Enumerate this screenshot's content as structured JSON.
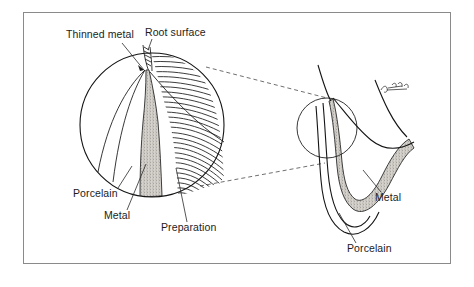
{
  "figure": {
    "border_color": "#8a8a8a",
    "background": "#ffffff",
    "ink_color": "#141414",
    "metal_fill_color": "#b9b5ae",
    "porcelain_fill_color": "#ffffff"
  },
  "labels": {
    "thinned_metal": "Thinned metal",
    "root_surface": "Root surface",
    "porcelain_left": "Porcelain",
    "metal_left": "Metal",
    "preparation": "Preparation",
    "metal_right": "Metal",
    "porcelain_right": "Porcelain"
  },
  "regions": {
    "magnified_circle": "magnified-detail-circle",
    "detail_marker_circle": "detail-marker-circle",
    "preparation_hatching": "preparation-hatched-region",
    "metal_band": "stippled-metal-band",
    "porcelain_body": "porcelain-body",
    "tooth_section": "tooth-cross-section",
    "artist_mark": "artist-signature-mark"
  },
  "connectors": {
    "upper_dashed": "upper-magnification-dashed-line",
    "lower_dashed": "lower-magnification-dashed-line"
  }
}
